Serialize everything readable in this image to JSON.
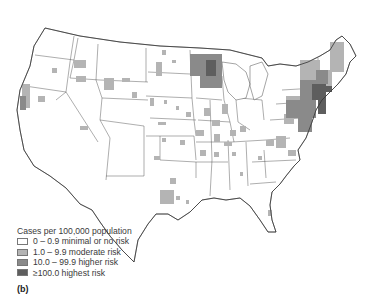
{
  "map": {
    "subject": "United States choropleth map of cases per 100,000 population by county",
    "colors": {
      "minimal": "#ffffff",
      "moderate": "#b4b4b4",
      "higher": "#8a8a8a",
      "highest": "#5e5e5e",
      "border": "#4a4a4a"
    }
  },
  "legend": {
    "title": "Cases per 100,000 population",
    "items": [
      {
        "label": "0 – 0.9 minimal or no risk",
        "color": "#ffffff"
      },
      {
        "label": "1.0 – 9.9 moderate risk",
        "color": "#b4b4b4"
      },
      {
        "label": "10.0 – 99.9 higher risk",
        "color": "#8a8a8a"
      },
      {
        "label": "≥100.0 highest risk",
        "color": "#5e5e5e"
      }
    ]
  },
  "panel_label": "(b)"
}
